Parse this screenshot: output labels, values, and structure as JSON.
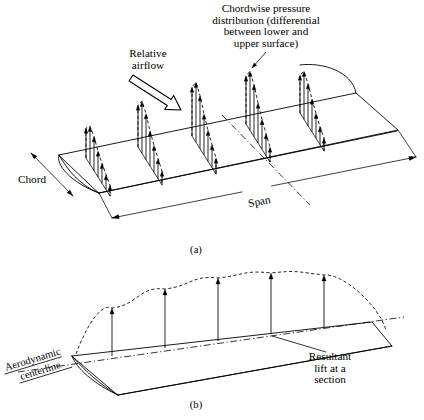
{
  "figure": {
    "background_color": "#ffffff",
    "ink_color": "#000000",
    "width": 424,
    "height": 420
  },
  "panel_a": {
    "caption": "(a)",
    "caption_pos": {
      "x": 196,
      "y": 253
    },
    "labels": {
      "chordwise": {
        "lines": [
          "Chordwise pressure",
          "distribution (differential",
          "between lower and",
          "upper surface)"
        ],
        "anchor_x": 266,
        "first_line_y": 12,
        "line_height": 11.6
      },
      "relative_airflow": {
        "lines": [
          "Relative",
          "airflow"
        ],
        "anchor_x": 148,
        "first_line_y": 57,
        "line_height": 11.6
      },
      "chord": {
        "text": "Chord",
        "x": 18,
        "y": 183
      },
      "span": {
        "text": "Span",
        "x": 260,
        "y": 205
      }
    },
    "wing_outline": {
      "leading_edge_root_top": {
        "x": 59,
        "y": 155
      },
      "leading_edge_tip_top": {
        "x": 356,
        "y": 93
      },
      "tip_outer": {
        "x": 398,
        "y": 130
      },
      "trailing_edge_root": {
        "x": 99,
        "y": 193
      },
      "root_lower": {
        "x": 99,
        "y": 193
      },
      "trailing_tip": {
        "x": 398,
        "y": 130
      }
    },
    "chord_dimension": {
      "top": {
        "x": 31,
        "y": 153
      },
      "bottom": {
        "x": 73,
        "y": 196
      }
    },
    "span_dimension": {
      "start": {
        "x": 112,
        "y": 218
      },
      "end": {
        "x": 416,
        "y": 157
      }
    },
    "centerline": {
      "start": {
        "x": 222,
        "y": 115
      },
      "end": {
        "x": 310,
        "y": 205
      }
    },
    "pressure_stations": [
      {
        "name": "station-1",
        "base_x": 86,
        "base_y": 158,
        "chord_dx": 24,
        "chord_dy": 38,
        "peak": 38,
        "arrow_heights": [
          30,
          38,
          34,
          26,
          20,
          15,
          11
        ]
      },
      {
        "name": "station-2",
        "base_x": 138,
        "base_y": 147,
        "chord_dx": 24,
        "chord_dy": 38,
        "peak": 52,
        "arrow_heights": [
          42,
          52,
          46,
          35,
          27,
          20,
          14
        ]
      },
      {
        "name": "station-3",
        "base_x": 192,
        "base_y": 136,
        "chord_dx": 24,
        "chord_dy": 38,
        "peak": 60,
        "arrow_heights": [
          49,
          60,
          53,
          41,
          31,
          23,
          16
        ]
      },
      {
        "name": "station-4",
        "base_x": 246,
        "base_y": 124,
        "chord_dx": 24,
        "chord_dy": 38,
        "peak": 59,
        "arrow_heights": [
          48,
          59,
          52,
          40,
          30,
          22,
          15
        ]
      },
      {
        "name": "station-5",
        "base_x": 300,
        "base_y": 113,
        "chord_dx": 24,
        "chord_dy": 38,
        "peak": 48,
        "arrow_heights": [
          38,
          48,
          42,
          33,
          25,
          18,
          13
        ]
      }
    ],
    "spanwise_envelope": {
      "description": "solid curve falling to zero at the tip",
      "start": {
        "x": 300,
        "y": 65
      },
      "tip": {
        "x": 356,
        "y": 93
      }
    },
    "relative_airflow_arrow": {
      "from": {
        "x": 131,
        "y": 78
      },
      "to": {
        "x": 181,
        "y": 110
      }
    },
    "chordwise_leader": {
      "from": {
        "x": 266,
        "y": 52
      },
      "to": {
        "x": 252,
        "y": 68
      }
    }
  },
  "panel_b": {
    "caption": "(b)",
    "caption_pos": {
      "x": 196,
      "y": 408
    },
    "labels": {
      "aerodynamic_centerline": {
        "lines": [
          "Aerodynamic",
          "centerline"
        ],
        "x": 6,
        "y": 371,
        "rotation_deg": -17
      },
      "resultant_lift": {
        "lines": [
          "Resultant",
          "lift at a",
          "section"
        ],
        "anchor_x": 330,
        "first_line_y": 360,
        "line_height": 11.6
      }
    },
    "wing_outline": {
      "apex": {
        "x": 72,
        "y": 356
      },
      "leading_tip": {
        "x": 372,
        "y": 322
      },
      "tip_outer": {
        "x": 392,
        "y": 346
      },
      "root_lower": {
        "x": 118,
        "y": 395
      }
    },
    "centerline": {
      "start": {
        "x": 18,
        "y": 372
      },
      "end": {
        "x": 404,
        "y": 317
      }
    },
    "lift_envelope": {
      "description": "dashed elliptical spanwise lift distribution"
    },
    "lift_arrows": [
      {
        "name": "lift-arrow-1",
        "base_x": 112,
        "base_y": 356,
        "height": 48
      },
      {
        "name": "lift-arrow-2",
        "base_x": 165,
        "base_y": 348,
        "height": 59
      },
      {
        "name": "lift-arrow-3",
        "base_x": 218,
        "base_y": 341,
        "height": 63
      },
      {
        "name": "lift-arrow-4",
        "base_x": 271,
        "base_y": 334,
        "height": 61
      },
      {
        "name": "lift-arrow-5",
        "base_x": 324,
        "base_y": 327,
        "height": 52
      }
    ],
    "resultant_leader": {
      "from": {
        "x": 326,
        "y": 352
      },
      "to": {
        "x": 272,
        "y": 336
      }
    }
  }
}
